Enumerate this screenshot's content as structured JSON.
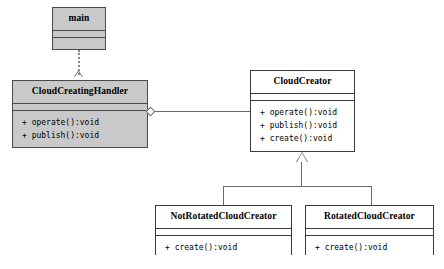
{
  "diagram": {
    "kind": "uml-class-diagram",
    "background_color": "#ffffff",
    "line_color": "#6a6a6a",
    "border_color": "#3a3a3a",
    "fill_highlight_color": "#c9c9c9",
    "fill_plain_color": "#ffffff"
  },
  "classes": {
    "main": {
      "name": "main",
      "attributes": [],
      "operations": []
    },
    "cloud_creating_handler": {
      "name": "CloudCreatingHandler",
      "attributes": [],
      "operations": [
        "+ operate():void",
        "+ publish():void"
      ]
    },
    "cloud_creator": {
      "name": "CloudCreator",
      "attributes": [],
      "operations": [
        "+ operate():void",
        "+ publish():void",
        "+ create():void"
      ]
    },
    "not_rotated_cloud_creator": {
      "name": "NotRotatedCloudCreator",
      "attributes": [],
      "operations": [
        "+ create():void"
      ]
    },
    "rotated_cloud_creator": {
      "name": "RotatedCloudCreator",
      "attributes": [],
      "operations": [
        "+ create():void"
      ]
    }
  },
  "relations": [
    {
      "id": "dependency-main-to-handler",
      "type": "dependency",
      "style": "dotted",
      "from": "main",
      "to": "CloudCreatingHandler",
      "arrow": "open-arrow"
    },
    {
      "id": "aggregation-handler-to-creator",
      "type": "aggregation",
      "style": "solid",
      "from": "CloudCreatingHandler",
      "to": "CloudCreator",
      "arrow": "hollow-diamond"
    },
    {
      "id": "generalization-notrotated-to-creator",
      "type": "generalization",
      "style": "solid",
      "from": "NotRotatedCloudCreator",
      "to": "CloudCreator",
      "arrow": "hollow-triangle"
    },
    {
      "id": "generalization-rotated-to-creator",
      "type": "generalization",
      "style": "solid",
      "from": "RotatedCloudCreator",
      "to": "CloudCreator",
      "arrow": "hollow-triangle"
    }
  ]
}
